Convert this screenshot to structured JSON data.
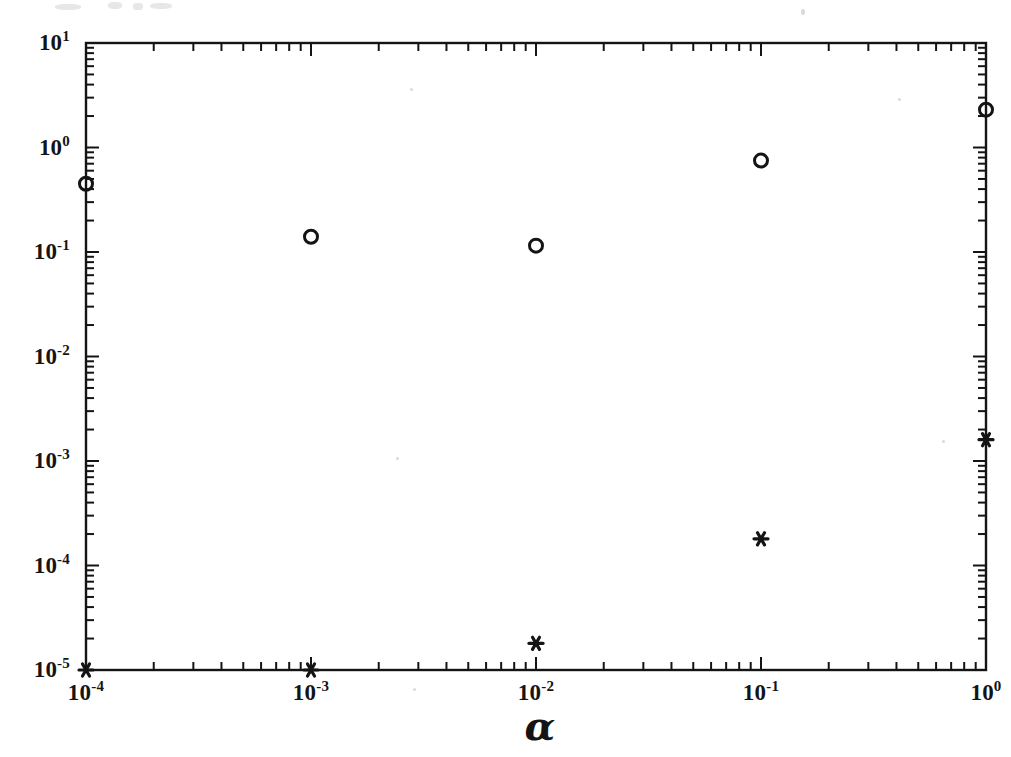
{
  "chart_data": {
    "type": "scatter",
    "title": "",
    "subtitle": "",
    "xlabel": "α",
    "ylabel": "",
    "xscale": "log",
    "yscale": "log",
    "xlim": [
      0.0001,
      1
    ],
    "ylim": [
      1e-05,
      10
    ],
    "grid": false,
    "legend_position": "none",
    "xticks": [
      0.0001,
      0.001,
      0.01,
      0.1,
      1
    ],
    "xtick_labels": [
      "10-4",
      "10-3",
      "10-2",
      "10-1",
      "100"
    ],
    "xtick_mantissa": [
      "10",
      "10",
      "10",
      "10",
      "10"
    ],
    "xtick_exponent": [
      "-4",
      "-3",
      "-2",
      "-1",
      "0"
    ],
    "yticks": [
      10,
      1,
      0.1,
      0.01,
      0.001,
      0.0001,
      1e-05
    ],
    "ytick_labels": [
      "101",
      "100",
      "10-1",
      "10-2",
      "10-3",
      "10-4",
      "10-5"
    ],
    "ytick_mantissa": [
      "10",
      "10",
      "10",
      "10",
      "10",
      "10",
      "10"
    ],
    "ytick_exponent": [
      "1",
      "0",
      "-1",
      "-2",
      "-3",
      "-4",
      "-5"
    ],
    "minor_ticks": true,
    "series": [
      {
        "name": "circle-series",
        "marker": "circle",
        "color": "#141414",
        "x": [
          0.0001,
          0.001,
          0.01,
          0.1,
          1
        ],
        "values": [
          0.45,
          0.14,
          0.115,
          0.75,
          2.3
        ]
      },
      {
        "name": "asterisk-series",
        "marker": "asterisk",
        "color": "#141414",
        "x": [
          0.0001,
          0.001,
          0.01,
          0.1,
          1
        ],
        "values": [
          1e-05,
          1e-05,
          1.8e-05,
          0.00018,
          0.0016
        ]
      }
    ]
  },
  "axes": {
    "frame_color": "#141414",
    "background": "#ffffff"
  }
}
